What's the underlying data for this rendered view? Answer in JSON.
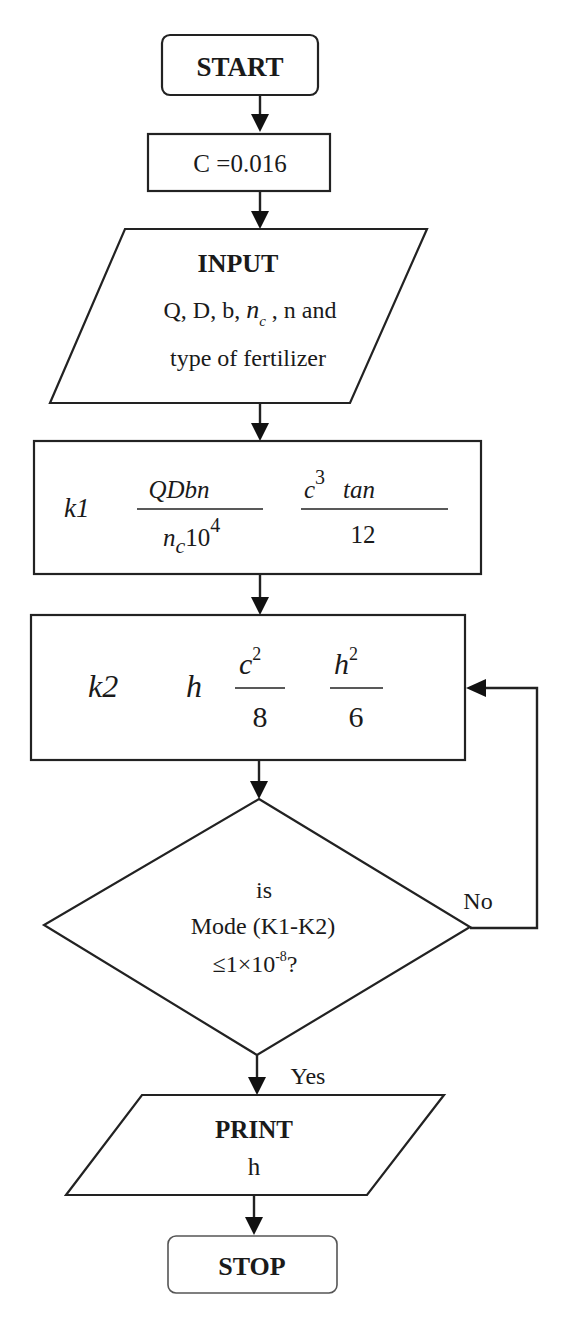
{
  "diagram": {
    "type": "flowchart",
    "colors": {
      "stroke": "#222222",
      "fill": "#ffffff",
      "text": "#1a1a1a"
    },
    "nodes": {
      "start": {
        "shape": "terminator",
        "label": "START"
      },
      "set_c": {
        "shape": "process",
        "label": "C =0.016"
      },
      "input": {
        "shape": "input-output",
        "title": "INPUT",
        "line1_a": "Q, D, b, ",
        "line1_var": "n",
        "line1_sub": "c",
        "line1_b": " , n and",
        "line2": "type of fertilizer"
      },
      "k1": {
        "shape": "process",
        "lhs": "k1",
        "frac1_num": "QDbn",
        "frac1_den_var": "n",
        "frac1_den_sub": "c",
        "frac1_den_num": "10",
        "frac1_den_exp": "4",
        "frac2_num_var": "c",
        "frac2_num_exp": "3",
        "frac2_num_func": "tan",
        "frac2_den": "12"
      },
      "k2": {
        "shape": "process",
        "lhs": "k2",
        "var": "h",
        "frac1_num_var": "c",
        "frac1_num_exp": "2",
        "frac1_den": "8",
        "frac2_num_var": "h",
        "frac2_num_exp": "2",
        "frac2_den": "6"
      },
      "decision": {
        "shape": "decision",
        "line1": "is",
        "line2": "Mode (K1-K2)",
        "line3_a": "≤1×10",
        "line3_exp": "-8",
        "line3_b": "?"
      },
      "print": {
        "shape": "input-output",
        "title": "PRINT",
        "value": "h"
      },
      "stop": {
        "shape": "terminator",
        "label": "STOP"
      }
    },
    "edges": [
      {
        "from": "start",
        "to": "set_c"
      },
      {
        "from": "set_c",
        "to": "input"
      },
      {
        "from": "input",
        "to": "k1"
      },
      {
        "from": "k1",
        "to": "k2"
      },
      {
        "from": "k2",
        "to": "decision"
      },
      {
        "from": "decision",
        "to": "k2",
        "label": "No"
      },
      {
        "from": "decision",
        "to": "print",
        "label": "Yes"
      },
      {
        "from": "print",
        "to": "stop"
      }
    ],
    "edge_labels": {
      "no": "No",
      "yes": "Yes"
    }
  }
}
